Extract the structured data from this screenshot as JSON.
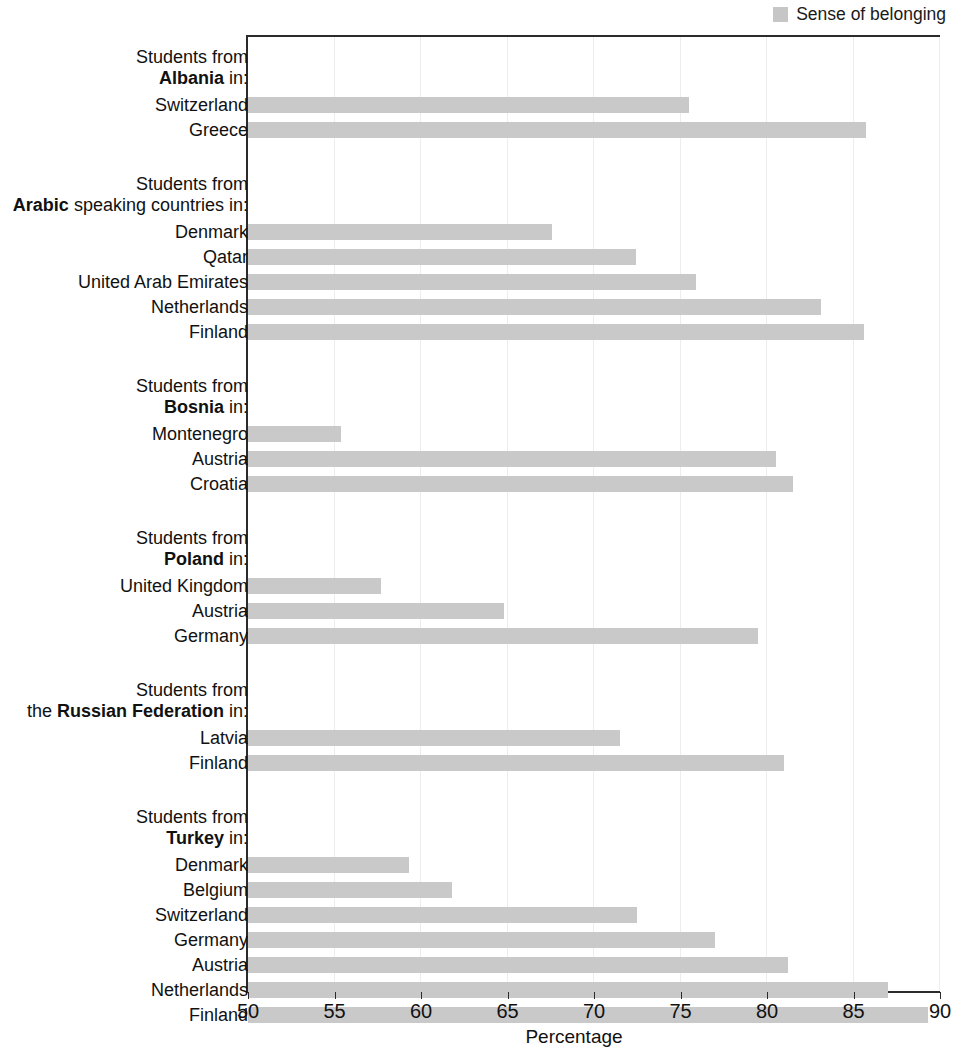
{
  "legend": {
    "label": "Sense of belonging",
    "color": "#c9c9c9"
  },
  "axis": {
    "x_title": "Percentage",
    "x_ticks": [
      50,
      55,
      60,
      65,
      70,
      75,
      80,
      85,
      90
    ],
    "x_min": 50,
    "x_max": 90
  },
  "groups": [
    {
      "head_line1": "Students from",
      "head_line2_prefix": "",
      "head_line2_bold": "Albania",
      "head_line2_suffix": " in:",
      "rows": [
        {
          "label": "Switzerland",
          "value": 75.5
        },
        {
          "label": "Greece",
          "value": 85.7
        }
      ]
    },
    {
      "head_line1": "Students from",
      "head_line2_prefix": "",
      "head_line2_bold": "Arabic",
      "head_line2_suffix": " speaking countries in:",
      "rows": [
        {
          "label": "Denmark",
          "value": 67.6
        },
        {
          "label": "Qatar",
          "value": 72.4
        },
        {
          "label": "United Arab Emirates",
          "value": 75.9
        },
        {
          "label": "Netherlands",
          "value": 83.1
        },
        {
          "label": "Finland",
          "value": 85.6
        }
      ]
    },
    {
      "head_line1": "Students from",
      "head_line2_prefix": "",
      "head_line2_bold": "Bosnia",
      "head_line2_suffix": " in:",
      "rows": [
        {
          "label": "Montenegro",
          "value": 55.4
        },
        {
          "label": "Austria",
          "value": 80.5
        },
        {
          "label": "Croatia",
          "value": 81.5
        }
      ]
    },
    {
      "head_line1": "Students from",
      "head_line2_prefix": "",
      "head_line2_bold": "Poland",
      "head_line2_suffix": " in:",
      "rows": [
        {
          "label": "United Kingdom",
          "value": 57.7
        },
        {
          "label": "Austria",
          "value": 64.8
        },
        {
          "label": "Germany",
          "value": 79.5
        }
      ]
    },
    {
      "head_line1": "Students from",
      "head_line2_prefix": "the ",
      "head_line2_bold": "Russian Federation",
      "head_line2_suffix": " in:",
      "rows": [
        {
          "label": "Latvia",
          "value": 71.5
        },
        {
          "label": "Finland",
          "value": 81.0
        }
      ]
    },
    {
      "head_line1": "Students from",
      "head_line2_prefix": "",
      "head_line2_bold": "Turkey",
      "head_line2_suffix": " in:",
      "rows": [
        {
          "label": "Denmark",
          "value": 59.3
        },
        {
          "label": "Belgium",
          "value": 61.8
        },
        {
          "label": "Switzerland",
          "value": 72.5
        },
        {
          "label": "Germany",
          "value": 77.0
        },
        {
          "label": "Austria",
          "value": 81.2
        },
        {
          "label": "Netherlands",
          "value": 87.0
        },
        {
          "label": "Finland",
          "value": 89.3
        }
      ]
    }
  ],
  "chart_data": {
    "type": "bar",
    "orientation": "horizontal",
    "title": "",
    "xlabel": "Percentage",
    "ylabel": "",
    "xlim": [
      50,
      90
    ],
    "grid": true,
    "legend": [
      "Sense of belonging"
    ],
    "legend_position": "top-right",
    "series": [
      {
        "name": "Sense of belonging",
        "color": "#c9c9c9",
        "groups": [
          {
            "origin": "Albania",
            "categories": [
              "Switzerland",
              "Greece"
            ],
            "values": [
              75.5,
              85.7
            ]
          },
          {
            "origin": "Arabic speaking countries",
            "categories": [
              "Denmark",
              "Qatar",
              "United Arab Emirates",
              "Netherlands",
              "Finland"
            ],
            "values": [
              67.6,
              72.4,
              75.9,
              83.1,
              85.6
            ]
          },
          {
            "origin": "Bosnia",
            "categories": [
              "Montenegro",
              "Austria",
              "Croatia"
            ],
            "values": [
              55.4,
              80.5,
              81.5
            ]
          },
          {
            "origin": "Poland",
            "categories": [
              "United Kingdom",
              "Austria",
              "Germany"
            ],
            "values": [
              57.7,
              64.8,
              79.5
            ]
          },
          {
            "origin": "the Russian Federation",
            "categories": [
              "Latvia",
              "Finland"
            ],
            "values": [
              71.5,
              81.0
            ]
          },
          {
            "origin": "Turkey",
            "categories": [
              "Denmark",
              "Belgium",
              "Switzerland",
              "Germany",
              "Austria",
              "Netherlands",
              "Finland"
            ],
            "values": [
              59.3,
              61.8,
              72.5,
              77.0,
              81.2,
              87.0,
              89.3
            ]
          }
        ]
      }
    ]
  }
}
